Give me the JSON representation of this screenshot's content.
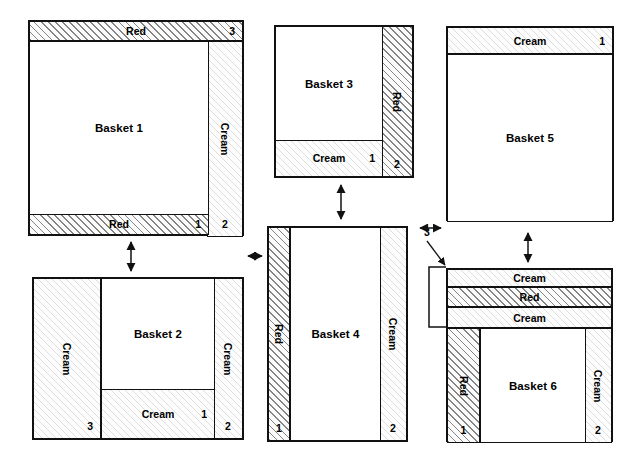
{
  "diagram": {
    "type": "basket-layer-diagram",
    "materials": {
      "red": "Red",
      "cream": "Cream"
    },
    "baskets": [
      {
        "id": "basket-1",
        "label": "Basket 1",
        "bands": [
          {
            "slot": "top",
            "material": "Red",
            "number": "3",
            "orientation": "horizontal"
          },
          {
            "slot": "bottom",
            "material": "Red",
            "number": "1",
            "orientation": "horizontal"
          },
          {
            "slot": "right",
            "material": "Cream",
            "number": "2",
            "orientation": "vertical"
          }
        ]
      },
      {
        "id": "basket-2",
        "label": "Basket 2",
        "bands": [
          {
            "slot": "left",
            "material": "Cream",
            "number": "3",
            "orientation": "vertical"
          },
          {
            "slot": "bottom",
            "material": "Cream",
            "number": "1",
            "orientation": "horizontal"
          },
          {
            "slot": "right",
            "material": "Cream",
            "number": "2",
            "orientation": "vertical"
          }
        ]
      },
      {
        "id": "basket-3",
        "label": "Basket 3",
        "bands": [
          {
            "slot": "bottom",
            "material": "Cream",
            "number": "1",
            "orientation": "horizontal"
          },
          {
            "slot": "right",
            "material": "Red",
            "number": "2",
            "orientation": "vertical"
          }
        ]
      },
      {
        "id": "basket-4",
        "label": "Basket 4",
        "bands": [
          {
            "slot": "left",
            "material": "Red",
            "number": "1",
            "orientation": "vertical"
          },
          {
            "slot": "right",
            "material": "Cream",
            "number": "2",
            "orientation": "vertical"
          }
        ]
      },
      {
        "id": "basket-5",
        "label": "Basket 5",
        "bands": [
          {
            "slot": "top",
            "material": "Cream",
            "number": "1",
            "orientation": "horizontal"
          }
        ]
      },
      {
        "id": "basket-6",
        "label": "Basket 6",
        "bands": [
          {
            "slot": "top-1",
            "material": "Cream",
            "number": "",
            "orientation": "horizontal"
          },
          {
            "slot": "top-2",
            "material": "Red",
            "number": "",
            "orientation": "horizontal"
          },
          {
            "slot": "top-3",
            "material": "Cream",
            "number": "",
            "orientation": "horizontal"
          },
          {
            "slot": "left",
            "material": "Red",
            "number": "1",
            "orientation": "vertical"
          },
          {
            "slot": "right",
            "material": "Cream",
            "number": "2",
            "orientation": "vertical"
          }
        ],
        "bracket_callout": {
          "number": "3",
          "spans": "top-1,top-2,top-3"
        }
      }
    ],
    "connections": [
      {
        "from": "basket-1",
        "to": "basket-2",
        "orientation": "vertical",
        "style": "double-arrow"
      },
      {
        "from": "basket-2",
        "to": "basket-4",
        "orientation": "horizontal",
        "style": "double-arrow"
      },
      {
        "from": "basket-3",
        "to": "basket-4",
        "orientation": "vertical",
        "style": "double-arrow"
      },
      {
        "from": "basket-4",
        "to": "basket-5",
        "orientation": "horizontal",
        "style": "double-arrow"
      },
      {
        "from": "basket-5",
        "to": "basket-6",
        "orientation": "vertical",
        "style": "double-arrow"
      }
    ]
  }
}
